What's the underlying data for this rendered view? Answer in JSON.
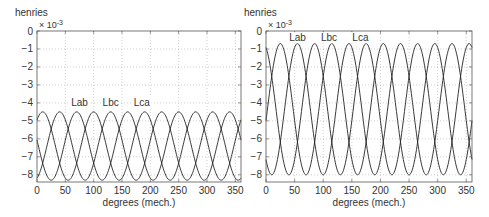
{
  "chart_data": [
    {
      "type": "line",
      "title": "",
      "xlabel": "degrees (mech.)",
      "ylabel": "henries",
      "y_multiplier": "× 10^-3",
      "xlim": [
        0,
        360
      ],
      "ylim": [
        -8.4,
        0
      ],
      "xticks": [
        0,
        50,
        100,
        150,
        200,
        250,
        300,
        350
      ],
      "yticks": [
        0,
        -1,
        -2,
        -3,
        -4,
        -5,
        -6,
        -7,
        -8
      ],
      "grid": true,
      "annotations": [
        {
          "text": "Lab",
          "x": 75,
          "y": -4.0
        },
        {
          "text": "Lbc",
          "x": 130,
          "y": -4.0
        },
        {
          "text": "Lca",
          "x": 185,
          "y": -4.0
        }
      ],
      "series": [
        {
          "name": "Lab",
          "mean": -6.4,
          "amplitude": 1.9,
          "period_deg": 90,
          "peak_at_deg": 10
        },
        {
          "name": "Lbc",
          "mean": -6.4,
          "amplitude": 1.9,
          "period_deg": 90,
          "peak_at_deg": 40
        },
        {
          "name": "Lca",
          "mean": -6.4,
          "amplitude": 1.9,
          "period_deg": 90,
          "peak_at_deg": 70
        }
      ],
      "peak_value": -4.5,
      "trough_value": -8.3
    },
    {
      "type": "line",
      "title": "",
      "xlabel": "degrees (mech.)",
      "ylabel": "henries",
      "y_multiplier": "× 10^-3",
      "xlim": [
        0,
        360
      ],
      "ylim": [
        -8.4,
        0
      ],
      "xticks": [
        0,
        50,
        100,
        150,
        200,
        250,
        300,
        350
      ],
      "yticks": [
        0,
        -1,
        -2,
        -3,
        -4,
        -5,
        -6,
        -7,
        -8
      ],
      "grid": true,
      "annotations": [
        {
          "text": "Lab",
          "x": 55,
          "y": -0.4
        },
        {
          "text": "Lbc",
          "x": 110,
          "y": -0.4
        },
        {
          "text": "Lca",
          "x": 165,
          "y": -0.4
        }
      ],
      "series": [
        {
          "name": "Lab",
          "mean": -4.35,
          "amplitude": 3.65,
          "period_deg": 90,
          "peak_at_deg": 25
        },
        {
          "name": "Lbc",
          "mean": -4.35,
          "amplitude": 3.65,
          "period_deg": 90,
          "peak_at_deg": 55
        },
        {
          "name": "Lca",
          "mean": -4.35,
          "amplitude": 3.65,
          "period_deg": 90,
          "peak_at_deg": 85
        }
      ],
      "peak_value": -0.7,
      "trough_value": -8.0
    }
  ],
  "layout": {
    "panels": [
      {
        "left": 37,
        "right": 241,
        "top": 31,
        "bottom": 182,
        "ylabel_x": 15,
        "ylabel_y": 16
      },
      {
        "left": 266,
        "right": 472,
        "top": 31,
        "bottom": 182,
        "ylabel_x": 244,
        "ylabel_y": 16
      }
    ]
  }
}
